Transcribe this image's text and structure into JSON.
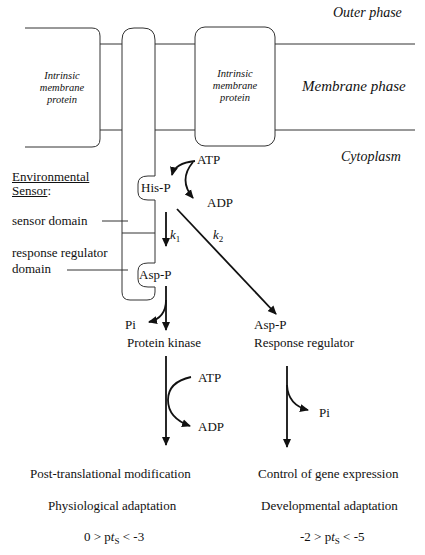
{
  "phases": {
    "outer": "Outer phase",
    "membrane": "Membrane phase",
    "cytoplasm": "Cytoplasm"
  },
  "proteins": {
    "left": [
      "Intrinsic",
      "membrane",
      "protein"
    ],
    "right": [
      "Intrinsic",
      "membrane",
      "protein"
    ]
  },
  "sensor": {
    "title_line1": "Environmental",
    "title_line2": "Sensor",
    "title_colon": ":",
    "sensor_domain": "sensor domain",
    "response_regulator_domain_line1": "response regulator",
    "response_regulator_domain_line2": "domain"
  },
  "molecules": {
    "his_p": "His-P",
    "asp_p_domain": "Asp-P",
    "atp_top": "ATP",
    "adp_top": "ADP",
    "pi_left": "Pi",
    "protein_kinase": "Protein kinase",
    "asp_p_rr": "Asp-P",
    "response_regulator": "Response regulator",
    "atp_mid": "ATP",
    "adp_mid": "ADP",
    "pi_right": "Pi"
  },
  "rates": {
    "k1_base": "k",
    "k1_sub": "1",
    "k2_base": "k",
    "k2_sub": "2"
  },
  "outcomes": {
    "left": {
      "line1": "Post-translational modification",
      "line2": "Physiological adaptation",
      "range_prefix": "0 > p",
      "range_var": "t",
      "range_sub": "S",
      "range_suffix": " < -3"
    },
    "right": {
      "line1": "Control of gene expression",
      "line2": "Developmental adaptation",
      "range_prefix": "-2 > p",
      "range_var": "t",
      "range_sub": "S",
      "range_suffix": " < -5"
    }
  }
}
